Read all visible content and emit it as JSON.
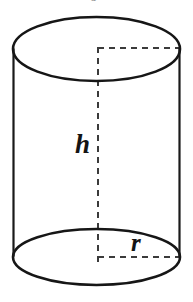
{
  "figure": {
    "name": "cylinder-diagram",
    "type": "geometric-solid",
    "shape": "cylinder",
    "background_color": "#ffffff",
    "stroke_color": "#161616",
    "dashed_stroke_color": "#3b3b3b",
    "label_color": "#141414",
    "width": 193,
    "height": 302
  },
  "labels": {
    "height_label": "h",
    "radius_label": "r",
    "clipped_top_glyph": "o"
  },
  "geometry": {
    "top_ellipse": {
      "cx": 96.5,
      "cy": 49,
      "rx": 83.5,
      "ry": 32
    },
    "bottom_ellipse": {
      "cx": 96.5,
      "cy": 257,
      "rx": 83.5,
      "ry": 28
    },
    "left_side": {
      "x": 13,
      "y1": 49,
      "y2": 257
    },
    "right_side": {
      "x": 180,
      "y1": 49,
      "y2": 257
    },
    "axis_dashed": {
      "x": 98,
      "y1": 47,
      "y2": 262
    },
    "top_radius_dashed": {
      "y": 48,
      "x1": 98,
      "x2": 180
    },
    "bottom_radius_dashed": {
      "y": 257,
      "x1": 98,
      "x2": 180
    }
  }
}
